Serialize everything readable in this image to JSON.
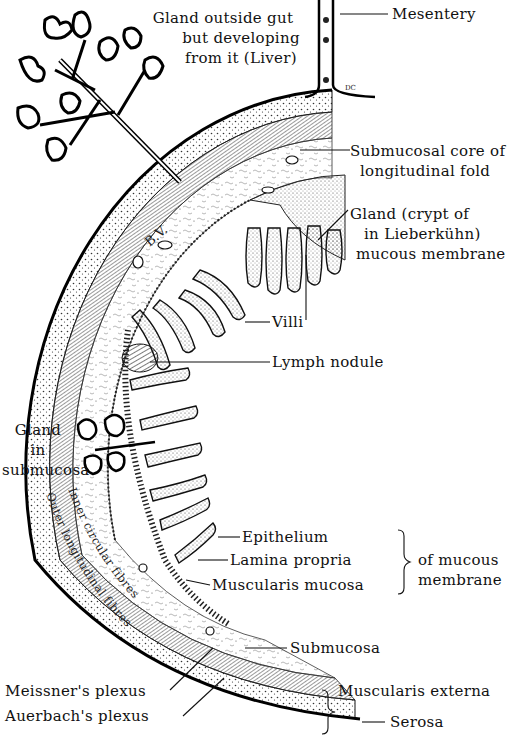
{
  "diagram": {
    "type": "anatomical-line-drawing",
    "colors": {
      "ink": "#111111",
      "background": "#ffffff",
      "stipple": "#333333"
    }
  },
  "labels": {
    "liver_gland": [
      "Gland outside gut",
      "but developing",
      "from it (Liver)"
    ],
    "mesentery": "Mesentery",
    "submucosal_core": [
      "Submucosal core of",
      "longitudinal fold"
    ],
    "crypt_gland": [
      "Gland  (crypt of",
      "in   Lieberkühn)",
      "mucous membrane"
    ],
    "villi": "Villi",
    "lymph_nodule": "Lymph nodule",
    "submucosa_gland": [
      "Gland",
      "in",
      "submucosa"
    ],
    "epithelium": "Epithelium",
    "lamina_propria": "Lamina propria",
    "muscularis_mucosa": "Muscularis mucosa",
    "mucous_membrane_group": [
      "of mucous",
      "membrane"
    ],
    "submucosa": "Submucosa",
    "meissner": "Meissner's plexus",
    "auerbach": "Auerbach's plexus",
    "muscularis_externa": "Muscularis externa",
    "serosa": "Serosa",
    "inner_circular": "Inner circular fibres",
    "outer_longitudinal": "Outer longitudinal fibres",
    "blood_vessel": "B.V.",
    "artist_mark": "DC"
  }
}
